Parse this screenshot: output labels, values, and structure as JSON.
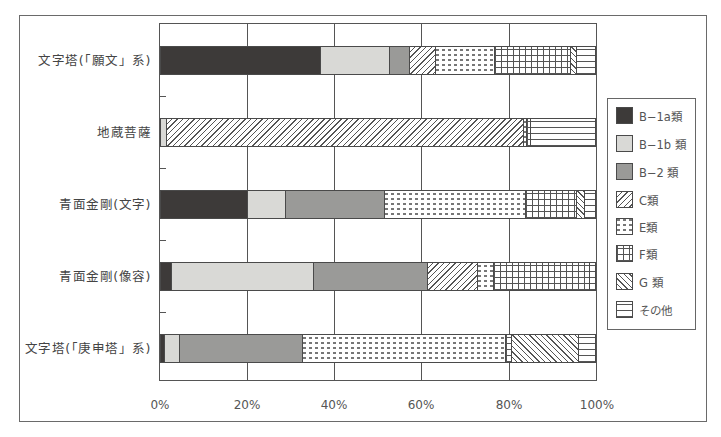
{
  "chart_data": {
    "type": "bar",
    "orientation": "horizontal",
    "stacked": true,
    "normalized": true,
    "title": "",
    "xlabel": "",
    "ylabel": "",
    "xlim": [
      0,
      100
    ],
    "x_ticks": [
      "0%",
      "20%",
      "40%",
      "60%",
      "80%",
      "100%"
    ],
    "grid": true,
    "legend_position": "right",
    "categories": [
      "文字塔(「願文」系)",
      "地蔵菩薩",
      "青面金剛(文字)",
      "青面金剛(像容)",
      "文字塔(「庚申塔」系)"
    ],
    "series": [
      {
        "name": "B−1a類",
        "pattern": "p-b1a",
        "values": [
          36.9,
          0,
          20.2,
          2.7,
          1.1
        ]
      },
      {
        "name": "B−1b類",
        "pattern": "p-b1b",
        "values": [
          15.7,
          1.6,
          8.8,
          32.7,
          3.4
        ]
      },
      {
        "name": "B−2類",
        "pattern": "p-b2",
        "values": [
          4.7,
          0,
          22.7,
          26.2,
          28.2
        ]
      },
      {
        "name": "C類",
        "pattern": "p-c",
        "values": [
          5.9,
          81.8,
          0,
          11.4,
          0
        ]
      },
      {
        "name": "E類",
        "pattern": "p-e",
        "values": [
          13.6,
          0.8,
          32.3,
          3.7,
          46.6
        ]
      },
      {
        "name": "F類",
        "pattern": "p-f",
        "values": [
          17.4,
          1.0,
          11.6,
          22.1,
          1.4
        ]
      },
      {
        "name": "G類",
        "pattern": "p-g",
        "values": [
          1.3,
          0,
          2.0,
          0,
          15.4
        ]
      },
      {
        "name": "その他",
        "pattern": "p-o",
        "values": [
          4.4,
          14.8,
          2.4,
          1.3,
          3.8
        ]
      }
    ]
  },
  "legend": {
    "items": [
      {
        "label": "B−1a類"
      },
      {
        "label": "B−1b 類"
      },
      {
        "label": "B−2 類"
      },
      {
        "label": "C類"
      },
      {
        "label": "E類"
      },
      {
        "label": "F類"
      },
      {
        "label": "G 類"
      },
      {
        "label": "その他"
      }
    ]
  },
  "axis": {
    "x_labels": [
      "0%",
      "20%",
      "40%",
      "60%",
      "80%",
      "100%"
    ],
    "y_labels": [
      "文字塔(「願文」系)",
      "地蔵菩薩",
      "青面金剛(文字)",
      "青面金剛(像容)",
      "文字塔(「庚申塔」系)"
    ]
  }
}
